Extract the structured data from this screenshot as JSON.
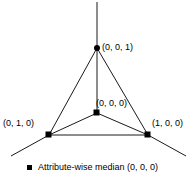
{
  "figure": {
    "type": "simplex-diagram",
    "background_color": "#ffffff",
    "stroke_color": "#000000",
    "marker_color": "#000000",
    "vertices": [
      {
        "name": "apex",
        "label": "(0, 0, 1)",
        "marker": "circle",
        "x": 97,
        "y": 48
      },
      {
        "name": "bottom-left",
        "label": "(0, 1, 0)",
        "marker": "square",
        "x": 49,
        "y": 135
      },
      {
        "name": "bottom-right",
        "label": "(1, 0, 0)",
        "marker": "square",
        "x": 148,
        "y": 135
      },
      {
        "name": "center",
        "label": "(0, 0, 0)",
        "marker": "square",
        "x": 97,
        "y": 113
      }
    ]
  },
  "labels": {
    "apex": "(0, 0, 1)",
    "bottom_left": "(0, 1, 0)",
    "bottom_right": "(1, 0, 0)",
    "center": "(0, 0, 0)"
  },
  "legend": {
    "marker": "square-marker",
    "text": "Attribute-wise median (0, 0, 0)"
  }
}
